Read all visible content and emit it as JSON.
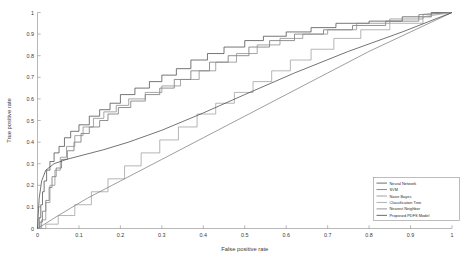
{
  "chart_data": {
    "type": "line",
    "title": "",
    "xlabel": "False positive rate",
    "ylabel": "True positive rate",
    "xlim": [
      0,
      1
    ],
    "ylim": [
      0,
      1
    ],
    "grid": false,
    "legend_position": "bottom-right",
    "xticks": [
      "0",
      "0.1",
      "0.2",
      "0.3",
      "0.4",
      "0.5",
      "0.6",
      "0.7",
      "0.8",
      "0.9",
      "1"
    ],
    "xtick_values": [
      0,
      0.1,
      0.2,
      0.3,
      0.4,
      0.5,
      0.6,
      0.7,
      0.8,
      0.9,
      1
    ],
    "yticks": [
      "0",
      "0.1",
      "0.2",
      "0.3",
      "0.4",
      "0.5",
      "0.6",
      "0.7",
      "0.8",
      "0.9",
      "1"
    ],
    "ytick_values": [
      0,
      0.1,
      0.2,
      0.3,
      0.4,
      0.5,
      0.6,
      0.7,
      0.8,
      0.9,
      1
    ],
    "series": [
      {
        "name": "Neural Network",
        "color": "#4a4a4a",
        "style": "step",
        "x": [
          0,
          0.004,
          0.004,
          0.008,
          0.008,
          0.012,
          0.012,
          0.016,
          0.016,
          0.022,
          0.022,
          0.03,
          0.03,
          0.04,
          0.04,
          0.052,
          0.052,
          0.065,
          0.065,
          0.08,
          0.08,
          0.1,
          0.1,
          0.125,
          0.125,
          0.15,
          0.15,
          0.175,
          0.175,
          0.2,
          0.2,
          0.235,
          0.235,
          0.27,
          0.27,
          0.3,
          0.3,
          0.335,
          0.335,
          0.37,
          0.37,
          0.41,
          0.41,
          0.45,
          0.45,
          0.5,
          0.5,
          0.545,
          0.545,
          0.6,
          0.6,
          0.66,
          0.66,
          0.72,
          0.72,
          0.8,
          0.8,
          0.88,
          0.88,
          0.95,
          0.95,
          1.0
        ],
        "y": [
          0,
          0,
          0.05,
          0.05,
          0.11,
          0.11,
          0.17,
          0.17,
          0.22,
          0.22,
          0.27,
          0.27,
          0.31,
          0.31,
          0.35,
          0.35,
          0.38,
          0.38,
          0.42,
          0.42,
          0.45,
          0.45,
          0.48,
          0.48,
          0.52,
          0.52,
          0.55,
          0.55,
          0.58,
          0.58,
          0.62,
          0.62,
          0.65,
          0.65,
          0.68,
          0.68,
          0.71,
          0.71,
          0.74,
          0.74,
          0.78,
          0.78,
          0.81,
          0.81,
          0.84,
          0.84,
          0.87,
          0.87,
          0.89,
          0.89,
          0.91,
          0.91,
          0.93,
          0.93,
          0.95,
          0.95,
          0.96,
          0.96,
          0.98,
          0.98,
          1.0,
          1.0
        ]
      },
      {
        "name": "SVM",
        "color": "#6e6e6e",
        "style": "step",
        "x": [
          0,
          0.006,
          0.006,
          0.012,
          0.012,
          0.02,
          0.02,
          0.028,
          0.028,
          0.035,
          0.035,
          0.045,
          0.045,
          0.058,
          0.058,
          0.072,
          0.072,
          0.088,
          0.088,
          0.105,
          0.105,
          0.125,
          0.125,
          0.15,
          0.15,
          0.17,
          0.17,
          0.195,
          0.195,
          0.225,
          0.225,
          0.26,
          0.26,
          0.295,
          0.295,
          0.33,
          0.33,
          0.37,
          0.37,
          0.415,
          0.415,
          0.46,
          0.46,
          0.51,
          0.51,
          0.56,
          0.56,
          0.62,
          0.62,
          0.69,
          0.69,
          0.76,
          0.76,
          0.84,
          0.84,
          0.92,
          0.92,
          1.0
        ],
        "y": [
          0,
          0,
          0.03,
          0.03,
          0.08,
          0.08,
          0.13,
          0.13,
          0.19,
          0.19,
          0.24,
          0.24,
          0.28,
          0.28,
          0.32,
          0.32,
          0.36,
          0.36,
          0.4,
          0.4,
          0.44,
          0.44,
          0.47,
          0.47,
          0.5,
          0.5,
          0.53,
          0.53,
          0.56,
          0.56,
          0.59,
          0.59,
          0.62,
          0.62,
          0.65,
          0.65,
          0.69,
          0.69,
          0.73,
          0.73,
          0.77,
          0.77,
          0.8,
          0.8,
          0.84,
          0.84,
          0.87,
          0.87,
          0.9,
          0.9,
          0.92,
          0.92,
          0.94,
          0.94,
          0.96,
          0.96,
          0.99,
          1.0
        ]
      },
      {
        "name": "Naive Bayes",
        "color": "#8a8a8a",
        "style": "step",
        "x": [
          0,
          0.01,
          0.01,
          0.02,
          0.02,
          0.03,
          0.03,
          0.042,
          0.042,
          0.055,
          0.055,
          0.07,
          0.07,
          0.09,
          0.09,
          0.11,
          0.11,
          0.135,
          0.135,
          0.16,
          0.16,
          0.19,
          0.19,
          0.22,
          0.22,
          0.26,
          0.26,
          0.3,
          0.3,
          0.345,
          0.345,
          0.39,
          0.39,
          0.43,
          0.43,
          0.48,
          0.48,
          0.53,
          0.53,
          0.585,
          0.585,
          0.64,
          0.64,
          0.7,
          0.7,
          0.77,
          0.77,
          0.85,
          0.85,
          0.93,
          0.93,
          1.0
        ],
        "y": [
          0,
          0,
          0.04,
          0.04,
          0.12,
          0.12,
          0.2,
          0.2,
          0.27,
          0.27,
          0.33,
          0.33,
          0.38,
          0.38,
          0.43,
          0.43,
          0.47,
          0.47,
          0.51,
          0.51,
          0.54,
          0.54,
          0.57,
          0.57,
          0.6,
          0.6,
          0.63,
          0.63,
          0.66,
          0.66,
          0.69,
          0.69,
          0.73,
          0.73,
          0.77,
          0.77,
          0.81,
          0.81,
          0.85,
          0.85,
          0.88,
          0.88,
          0.9,
          0.9,
          0.92,
          0.92,
          0.95,
          0.95,
          0.97,
          0.97,
          0.99,
          1.0
        ]
      },
      {
        "name": "Classification Tree",
        "color": "#9e9e9e",
        "style": "step",
        "x": [
          0,
          0.02,
          0.02,
          0.05,
          0.05,
          0.09,
          0.09,
          0.13,
          0.13,
          0.17,
          0.17,
          0.21,
          0.21,
          0.25,
          0.25,
          0.295,
          0.295,
          0.34,
          0.34,
          0.385,
          0.385,
          0.43,
          0.43,
          0.475,
          0.475,
          0.52,
          0.52,
          0.565,
          0.565,
          0.61,
          0.61,
          0.66,
          0.66,
          0.715,
          0.715,
          0.78,
          0.78,
          0.85,
          0.85,
          0.93,
          0.93,
          1.0
        ],
        "y": [
          0,
          0,
          0.02,
          0.02,
          0.06,
          0.06,
          0.11,
          0.11,
          0.17,
          0.17,
          0.23,
          0.23,
          0.29,
          0.29,
          0.35,
          0.35,
          0.41,
          0.41,
          0.47,
          0.47,
          0.53,
          0.53,
          0.58,
          0.58,
          0.63,
          0.63,
          0.68,
          0.68,
          0.73,
          0.73,
          0.78,
          0.78,
          0.83,
          0.83,
          0.88,
          0.88,
          0.92,
          0.92,
          0.95,
          0.95,
          0.98,
          1.0
        ]
      },
      {
        "name": "Nearest Neighbor",
        "color": "#7d7d7d",
        "style": "smooth",
        "x": [
          0,
          0.05,
          0.12,
          0.2,
          0.3,
          0.4,
          0.5,
          0.6,
          0.7,
          0.8,
          0.9,
          1.0
        ],
        "y": [
          0,
          0.06,
          0.14,
          0.22,
          0.32,
          0.42,
          0.52,
          0.62,
          0.72,
          0.82,
          0.91,
          1.0
        ]
      },
      {
        "name": "Proposed PDFS Model",
        "color": "#454545",
        "style": "smooth",
        "x": [
          0,
          0.004,
          0.01,
          0.02,
          0.04,
          0.07,
          0.11,
          0.16,
          0.22,
          0.3,
          0.4,
          0.5,
          0.62,
          0.75,
          0.88,
          1.0
        ],
        "y": [
          0,
          0.14,
          0.22,
          0.27,
          0.3,
          0.32,
          0.34,
          0.365,
          0.4,
          0.455,
          0.535,
          0.62,
          0.72,
          0.82,
          0.91,
          1.0
        ]
      }
    ]
  },
  "legend": {
    "entries": [
      "Neural Network",
      "SVM",
      "Naive Bayes",
      "Classification Tree",
      "Nearest Neighbor",
      "Proposed PDFS Model"
    ]
  }
}
